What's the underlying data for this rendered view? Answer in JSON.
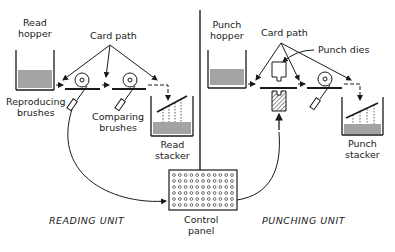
{
  "labels": {
    "read_hopper": [
      "Read",
      "hopper"
    ],
    "card_path_left": "Card path",
    "reproducing_brushes": [
      "Reproducing",
      "brushes"
    ],
    "comparing_brushes": [
      "Comparing",
      "brushes"
    ],
    "read_stacker": [
      "Read",
      "stacker"
    ],
    "punch_hopper": [
      "Punch",
      "hopper"
    ],
    "card_path_right": "Card path",
    "punch_dies": "Punch dies",
    "punch_stacker": [
      "Punch",
      "stacker"
    ],
    "control_panel": [
      "Control",
      "panel"
    ],
    "reading_unit": "READING UNIT",
    "punching_unit": "PUNCHING UNIT"
  },
  "control_panel_grid": {
    "columns": 11,
    "rows": 6
  },
  "colors": {
    "line": "#1a1a1a",
    "background": "#ffffff"
  }
}
